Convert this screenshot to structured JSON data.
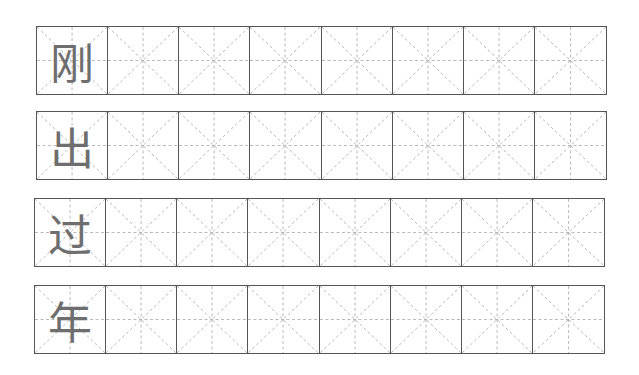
{
  "worksheet": {
    "cells_per_row": 8,
    "grid_color": "#555555",
    "guide_color": "#9a9a9a",
    "char_color": "#6e6e6e",
    "rows": [
      {
        "char": "刚",
        "left": 36,
        "top": 26
      },
      {
        "char": "出",
        "left": 36,
        "top": 111
      },
      {
        "char": "过",
        "left": 34,
        "top": 198
      },
      {
        "char": "年",
        "left": 34,
        "top": 285
      }
    ]
  }
}
